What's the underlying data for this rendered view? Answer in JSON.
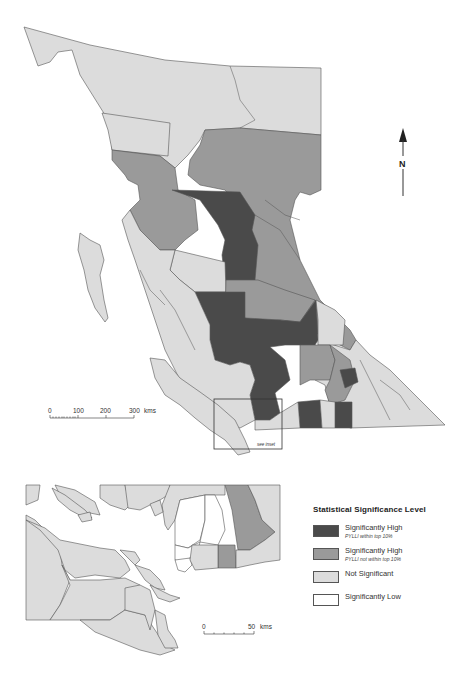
{
  "colors": {
    "sig_high_top10": "#4a4a4a",
    "sig_high_not_top10": "#9a9a9a",
    "not_significant": "#dcdcdc",
    "sig_low": "#ffffff",
    "border": "#555555",
    "water": "#ffffff"
  },
  "north_arrow": {
    "label": "N"
  },
  "main_scale": {
    "ticks": [
      "0",
      "100",
      "200",
      "300"
    ],
    "unit": "kms"
  },
  "inset_box_label": "see inset",
  "inset_scale": {
    "ticks": [
      "0",
      "50"
    ],
    "unit": "kms"
  },
  "legend": {
    "title": "Statistical Significance Level",
    "items": [
      {
        "label": "Significantly High",
        "sublabel": "PYLLI within top 10%",
        "category": "sig_high_top10"
      },
      {
        "label": "Significantly High",
        "sublabel": "PYLLI not within top 10%",
        "category": "sig_high_not_top10"
      },
      {
        "label": "Not Significant",
        "sublabel": "",
        "category": "not_significant"
      },
      {
        "label": "Significantly Low",
        "sublabel": "",
        "category": "sig_low"
      }
    ]
  }
}
